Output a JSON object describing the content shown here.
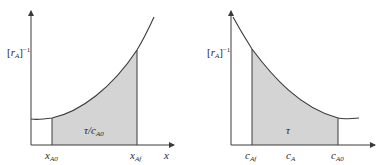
{
  "colors": {
    "line": "#3a3a3a",
    "shade": "#d4d4d4",
    "background": "#ffffff"
  },
  "left_plot": {
    "ylabel": {
      "bracket_open": "[",
      "var": "r",
      "sub": "A",
      "bracket_close": "]",
      "sup": "−1"
    },
    "xlabel": "x",
    "area_label": {
      "main": "τ/c",
      "sub": "A0"
    },
    "ticks": [
      {
        "main": "x",
        "sub": "A0"
      },
      {
        "main": "x",
        "sub": "Af"
      }
    ],
    "curve_shape": "increasing, concave up",
    "shaded_between": [
      "x_A0",
      "x_Af"
    ]
  },
  "right_plot": {
    "ylabel": {
      "bracket_open": "[",
      "var": "r",
      "sub": "A",
      "bracket_close": "]",
      "sup": "−1"
    },
    "xlabel": "",
    "area_label": {
      "main": "τ",
      "sub": ""
    },
    "ticks": [
      {
        "main": "c",
        "sub": "Af"
      },
      {
        "main": "c",
        "sub": "A"
      },
      {
        "main": "c",
        "sub": "A0"
      }
    ],
    "curve_shape": "decreasing, concave up",
    "shaded_between": [
      "c_Af",
      "c_A0"
    ]
  }
}
